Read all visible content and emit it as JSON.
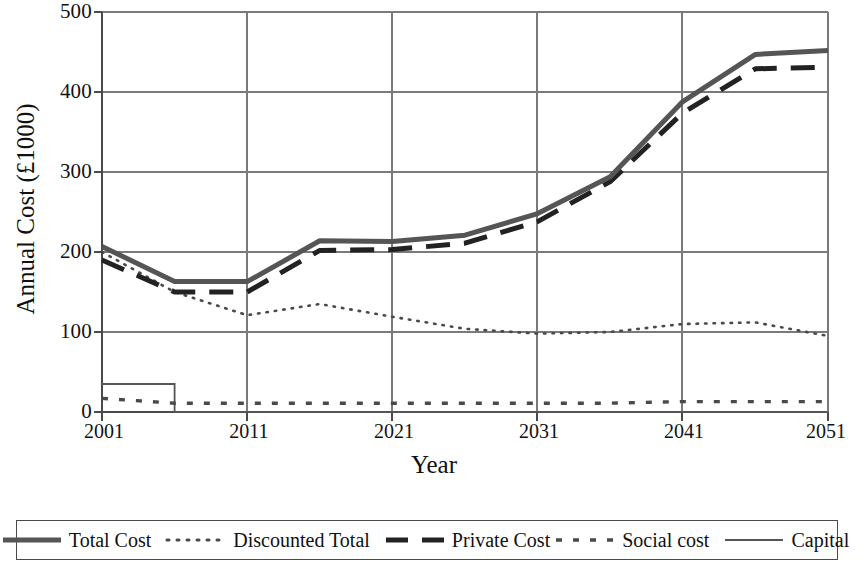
{
  "chart_data": {
    "type": "line",
    "title": "",
    "xlabel": "Year",
    "ylabel": "Annual Cost (£1000)",
    "xlim": [
      2001,
      2051
    ],
    "ylim": [
      0,
      500
    ],
    "yticks": [
      0,
      100,
      200,
      300,
      400,
      500
    ],
    "xticks": [
      2001,
      2011,
      2021,
      2031,
      2041,
      2051
    ],
    "grid": true,
    "legend_position": "below-plot",
    "series": [
      {
        "name": "Total Cost",
        "style": "solid-thick",
        "color": "#555555",
        "x": [
          2001,
          2006,
          2011,
          2016,
          2021,
          2026,
          2031,
          2036,
          2041,
          2046,
          2051
        ],
        "values": [
          207,
          163,
          163,
          214,
          213,
          221,
          248,
          294,
          388,
          447,
          452
        ]
      },
      {
        "name": "Discounted Total",
        "style": "dotted",
        "color": "#4a4a4a",
        "x": [
          2001,
          2006,
          2011,
          2016,
          2021,
          2026,
          2031,
          2036,
          2041,
          2046,
          2051
        ],
        "values": [
          200,
          150,
          121,
          135,
          119,
          104,
          98,
          100,
          110,
          112,
          95
        ]
      },
      {
        "name": "Private Cost",
        "style": "dashed-thick",
        "color": "#222222",
        "x": [
          2001,
          2006,
          2011,
          2016,
          2021,
          2026,
          2031,
          2036,
          2041,
          2046,
          2051
        ],
        "values": [
          190,
          150,
          150,
          202,
          203,
          211,
          238,
          288,
          374,
          429,
          431
        ]
      },
      {
        "name": "Social cost",
        "style": "dash-dot-small",
        "color": "#4a4a4a",
        "x": [
          2001,
          2006,
          2011,
          2016,
          2021,
          2026,
          2031,
          2036,
          2041,
          2046,
          2051
        ],
        "values": [
          17,
          11,
          11,
          11,
          11,
          11,
          11,
          11,
          13,
          13,
          13
        ]
      },
      {
        "name": "Capital",
        "style": "solid-thin",
        "color": "#555555",
        "x": [
          2001,
          2006,
          2006,
          2051
        ],
        "values": [
          35,
          35,
          0,
          0
        ]
      }
    ]
  },
  "axes": {
    "y_tick_labels": [
      "500",
      "400",
      "300",
      "200",
      "100",
      "0"
    ],
    "x_tick_labels": [
      "2001",
      "2011",
      "2021",
      "2031",
      "2041",
      "2051"
    ],
    "y_axis_title": "Annual Cost (£1000)",
    "x_axis_title": "Year"
  },
  "legend": {
    "items": [
      {
        "label": "Total Cost",
        "style": "solid-thick"
      },
      {
        "label": "Discounted Total",
        "style": "dotted"
      },
      {
        "label": "Private Cost",
        "style": "dashed-thick"
      },
      {
        "label": "Social cost",
        "style": "dash-dot-small"
      },
      {
        "label": "Capital",
        "style": "solid-thin"
      }
    ]
  },
  "colors": {
    "total_cost": "#555555",
    "discounted_total": "#4a4a4a",
    "private_cost": "#222222",
    "social_cost": "#4a4a4a",
    "capital": "#555555",
    "grid": "#7a7a7a",
    "axis": "#4a4a4a",
    "background": "#ffffff"
  }
}
